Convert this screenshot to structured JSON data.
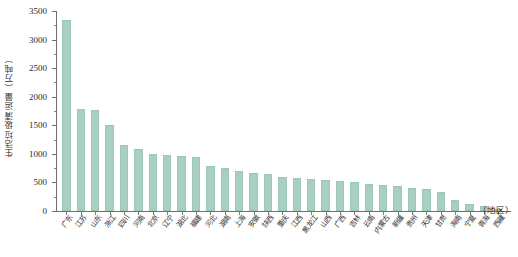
{
  "chart_data": {
    "type": "bar",
    "title": "",
    "subtitle": "",
    "ylabel": "生活垃圾清运量（万吨）",
    "xlabel": "",
    "x_unit_note": "（地区）",
    "ylim": [
      0,
      3500
    ],
    "y_ticks": [
      0,
      500,
      1000,
      1500,
      2000,
      2500,
      3000,
      3500
    ],
    "y_tick_labels": [
      "0",
      "500",
      "1000",
      "1500",
      "2000",
      "2500",
      "3000",
      "3500"
    ],
    "y_minor_tick_step": 250,
    "grid": false,
    "legend": null,
    "bar_color": "#a9cfc0",
    "axis_color": "#6f6f6f",
    "categories": [
      "广东",
      "江苏",
      "山东",
      "浙江",
      "四川",
      "河南",
      "北京",
      "辽宁",
      "湖北",
      "福建",
      "河北",
      "湖南",
      "上海",
      "安徽",
      "陕西",
      "重庆",
      "江西",
      "黑龙江",
      "山西",
      "广西",
      "吉林",
      "云南",
      "内蒙古",
      "新疆",
      "贵州",
      "天津",
      "甘肃",
      "海南",
      "宁夏",
      "青海",
      "西藏"
    ],
    "values": [
      3350,
      1790,
      1760,
      1500,
      1150,
      1090,
      1005,
      985,
      960,
      950,
      790,
      760,
      700,
      660,
      645,
      590,
      575,
      555,
      545,
      525,
      500,
      470,
      450,
      440,
      410,
      380,
      330,
      200,
      120,
      95,
      35
    ]
  }
}
